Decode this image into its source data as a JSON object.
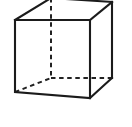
{
  "figure": {
    "name": "cube-line-drawing",
    "kind": "geometry-diagram",
    "background_color": "#ffffff",
    "visible_edge_color": "#1b1b1b",
    "hidden_edge_color": "#222222",
    "visible_edge_width": 2.1,
    "hidden_edge_width": 2.0,
    "hidden_edge_dash": "4.5 3.6",
    "canvas": {
      "width": 132,
      "height": 127
    }
  },
  "geometry": {
    "vertices": {
      "front_top_left": {
        "x": 15,
        "y": 20
      },
      "front_top_right": {
        "x": 90,
        "y": 20
      },
      "front_bottom_right": {
        "x": 90,
        "y": 98
      },
      "front_bottom_left": {
        "x": 15,
        "y": 92
      },
      "back_top_left": {
        "x": 51,
        "y": -2
      },
      "back_top_right": {
        "x": 112,
        "y": 2
      },
      "back_bottom_right": {
        "x": 112,
        "y": 78
      },
      "back_bottom_left": {
        "x": 51,
        "y": 78
      }
    },
    "visible_edges": [
      {
        "name": "front-top",
        "from": "front_top_left",
        "to": "front_top_right"
      },
      {
        "name": "front-right",
        "from": "front_top_right",
        "to": "front_bottom_right"
      },
      {
        "name": "front-bottom",
        "from": "front_bottom_right",
        "to": "front_bottom_left"
      },
      {
        "name": "front-left",
        "from": "front_bottom_left",
        "to": "front_top_left"
      },
      {
        "name": "top-left-receding",
        "from": "front_top_left",
        "to": "back_top_left"
      },
      {
        "name": "top-right-receding",
        "from": "front_top_right",
        "to": "back_top_right"
      },
      {
        "name": "back-top",
        "from": "back_top_left",
        "to": "back_top_right"
      },
      {
        "name": "back-right-vertical",
        "from": "back_top_right",
        "to": "back_bottom_right"
      },
      {
        "name": "bottom-right-receding",
        "from": "front_bottom_right",
        "to": "back_bottom_right"
      }
    ],
    "hidden_edges": [
      {
        "name": "back-left-vertical",
        "from": "back_top_left",
        "to": "back_bottom_left"
      },
      {
        "name": "back-bottom",
        "from": "back_bottom_left",
        "to": "back_bottom_right"
      },
      {
        "name": "bottom-left-receding",
        "from": "front_bottom_left",
        "to": "back_bottom_left"
      }
    ]
  },
  "path_data": {
    "front_face": "M15,20 L90,20 L90,98 L15,92 Z",
    "top_left_receding": "M15,20 L51,-2",
    "top_right_receding": "M90,20 L112,2",
    "back_top": "M51,-2 L112,2",
    "back_right_vertical": "M112,2 L112,78",
    "bottom_right_receding": "M90,98 L112,78",
    "hidden_back_left_vertical": "M51,-2 L51,78",
    "hidden_back_bottom": "M51,78 L112,78",
    "hidden_bottom_left_receding": "M15,92 L51,78"
  }
}
